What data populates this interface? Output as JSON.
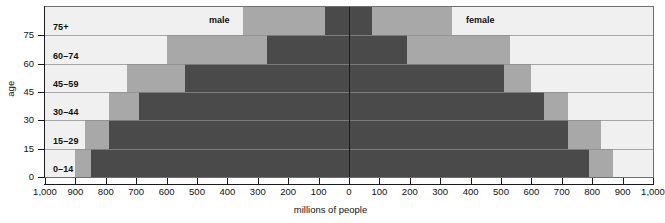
{
  "chart_data": {
    "type": "bar",
    "subtype": "population-pyramid",
    "title": "",
    "xlabel": "millions of people",
    "ylabel": "age",
    "categories": [
      "0–14",
      "15–29",
      "30–44",
      "45–59",
      "60–74",
      "75+"
    ],
    "xlim": [
      -1000,
      1000
    ],
    "xticks": [
      -1000,
      -900,
      -800,
      -700,
      -600,
      -500,
      -400,
      -300,
      -200,
      -100,
      0,
      100,
      200,
      300,
      400,
      500,
      600,
      700,
      800,
      900,
      1000
    ],
    "xticklabels": [
      "1,000",
      "900",
      "800",
      "700",
      "600",
      "500",
      "400",
      "300",
      "200",
      "100",
      "0",
      "100",
      "200",
      "300",
      "400",
      "500",
      "600",
      "700",
      "800",
      "900",
      "1,000"
    ],
    "yticks": [
      0,
      15,
      30,
      45,
      60,
      75
    ],
    "yticklabels": [
      "0",
      "15",
      "30",
      "45",
      "60",
      "75"
    ],
    "grid": false,
    "legend_position": "in-plot-top",
    "side_labels": {
      "left": "male",
      "right": "female"
    },
    "band_colors": {
      "dark": "#4a4a4a",
      "medium": "#a8a8a8",
      "light": "#f0f0f0"
    },
    "series": [
      {
        "name": "inner-dark",
        "color": "#4a4a4a",
        "male": [
          850,
          790,
          690,
          540,
          270,
          80
        ],
        "female": [
          790,
          720,
          640,
          510,
          190,
          75
        ]
      },
      {
        "name": "middle-medium",
        "color": "#a8a8a8",
        "male": [
          900,
          870,
          790,
          730,
          600,
          350
        ],
        "female": [
          870,
          830,
          720,
          600,
          530,
          340
        ]
      },
      {
        "name": "outer-light",
        "color": "#f0f0f0",
        "male": [
          1000,
          1000,
          1000,
          1000,
          1000,
          1000
        ],
        "female": [
          1000,
          1000,
          1000,
          1000,
          1000,
          1000
        ]
      }
    ]
  },
  "axes": {
    "x_title": "millions of people",
    "y_title": "age",
    "x_tick_labels": [
      "1,000",
      "900",
      "800",
      "700",
      "600",
      "500",
      "400",
      "300",
      "200",
      "100",
      "0",
      "100",
      "200",
      "300",
      "400",
      "500",
      "600",
      "700",
      "800",
      "900",
      "1,000"
    ],
    "y_tick_labels": [
      "75",
      "60",
      "45",
      "30",
      "15",
      "0"
    ]
  },
  "age_groups": [
    {
      "label": "75+"
    },
    {
      "label": "60–74"
    },
    {
      "label": "45–59"
    },
    {
      "label": "30–44"
    },
    {
      "label": "15–29"
    },
    {
      "label": "0–14"
    }
  ],
  "sides": {
    "male_label": "male",
    "female_label": "female"
  }
}
